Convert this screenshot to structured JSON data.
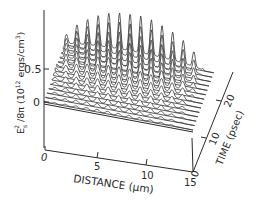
{
  "chart_data": {
    "type": "3d-waterfall",
    "title": "",
    "zlabel": "E_s^2 / 8π (10^12 ergs/cm^3)",
    "zlabel_parts": {
      "main": "E",
      "sub": "s",
      "sup": "2",
      "rest": "/8π (10",
      "exp": "12",
      "units": " ergs/cm",
      "units_exp": "3",
      "close": ")"
    },
    "xlabel": "DISTANCE (μm)",
    "ylabel": "TIME (psec)",
    "z_ticks": [
      "0",
      "0.5"
    ],
    "z_tick_values": [
      0,
      0.5
    ],
    "x_ticks": [
      "0",
      "5",
      "10",
      "15"
    ],
    "x_tick_values": [
      0,
      5,
      10,
      15
    ],
    "y_ticks": [
      "0",
      "10",
      "20"
    ],
    "y_tick_values": [
      0,
      10,
      20
    ],
    "xlim": [
      0,
      15
    ],
    "ylim": [
      0,
      25
    ],
    "zlim": [
      0,
      0.9
    ],
    "series_description": "Stacked traces of E_s^2/8π vs distance at successive times; spatially periodic peaks (~14 across 0–15 μm) grow in amplitude with time, reaching ~0.85 at late times near the left/center.",
    "num_traces": 14,
    "peaks_per_trace": 14,
    "peak_amplitude_by_trace": [
      0.04,
      0.06,
      0.08,
      0.1,
      0.13,
      0.16,
      0.2,
      0.25,
      0.3,
      0.36,
      0.43,
      0.5,
      0.58,
      0.66
    ]
  },
  "labels": {
    "z_tick_0": "0",
    "z_tick_05": "0.5",
    "x_tick_0": "0",
    "x_tick_5": "5",
    "x_tick_10": "10",
    "x_tick_15": "15",
    "y_tick_0": "0",
    "y_tick_10": "10",
    "y_tick_20": "20",
    "xlabel": "DISTANCE (μm)",
    "ylabel": "TIME (psec)",
    "zlabel": "E²/8π (10¹² ergs/cm³)"
  },
  "colors": {
    "ink": "#2a2a2a",
    "background": "#ffffff"
  }
}
